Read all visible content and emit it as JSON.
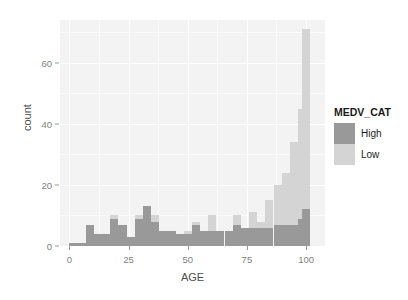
{
  "chart_data": {
    "type": "bar",
    "subtype": "stacked-histogram",
    "title": "",
    "xlabel": "AGE",
    "ylabel": "count",
    "xlim": [
      -4,
      108
    ],
    "ylim": [
      0,
      74
    ],
    "xticks": [
      0,
      25,
      50,
      75,
      100
    ],
    "xtick_labels": [
      "0",
      "25",
      "50",
      "75",
      "100"
    ],
    "yticks": [
      0,
      20,
      40,
      60
    ],
    "ytick_labels": [
      "0",
      "20",
      "40",
      "60"
    ],
    "grid": true,
    "legend": {
      "title": "MEDV_CAT",
      "position": "right",
      "entries": [
        {
          "label": "High",
          "color": "#999999"
        },
        {
          "label": "Low",
          "color": "#d4d4d4"
        }
      ]
    },
    "bin_width": 3.45,
    "bin_centers": [
      1.7,
      5.2,
      8.6,
      12.1,
      15.5,
      19.0,
      22.4,
      25.9,
      29.3,
      32.8,
      36.2,
      39.7,
      43.1,
      46.6,
      50.0,
      53.5,
      56.9,
      60.4,
      63.8,
      67.3,
      70.7,
      74.2,
      77.6,
      81.1,
      84.5,
      88.0,
      91.4,
      94.9,
      98.3,
      100.0
    ],
    "categories": [
      "1.7",
      "5.2",
      "8.6",
      "12.1",
      "15.5",
      "19.0",
      "22.4",
      "25.9",
      "29.3",
      "32.8",
      "36.2",
      "39.7",
      "43.1",
      "46.6",
      "50.0",
      "53.5",
      "56.9",
      "60.4",
      "63.8",
      "67.3",
      "70.7",
      "74.2",
      "77.6",
      "81.1",
      "84.5",
      "88.0",
      "91.4",
      "94.9",
      "98.3",
      "100.0"
    ],
    "series": [
      {
        "name": "High",
        "color": "#999999",
        "values": [
          1,
          1,
          7,
          4,
          4,
          9,
          7,
          3,
          9,
          13,
          8,
          5,
          5,
          4,
          4,
          7,
          5,
          5,
          5,
          5,
          7,
          6,
          6,
          6,
          6,
          7,
          7,
          7,
          9,
          12
        ]
      },
      {
        "name": "Low",
        "color": "#d4d4d4",
        "values": [
          0,
          0,
          0,
          0,
          0,
          1,
          0,
          0,
          1,
          0,
          2,
          0,
          0,
          0,
          1,
          1,
          0,
          5,
          0,
          0,
          3,
          0,
          5,
          2,
          9,
          13,
          17,
          27,
          36,
          59
        ]
      }
    ],
    "totals": [
      1,
      1,
      7,
      4,
      4,
      10,
      7,
      3,
      10,
      13,
      10,
      5,
      5,
      4,
      5,
      8,
      5,
      10,
      5,
      5,
      10,
      6,
      11,
      8,
      15,
      20,
      24,
      34,
      45,
      71
    ]
  },
  "style": {
    "panel_background": "#f3f3f3",
    "gridline_color": "#ffffff",
    "axis_text_color": "#808080",
    "axis_title_color": "#4d4d4d",
    "legend_title_color": "#1a1a1a"
  }
}
